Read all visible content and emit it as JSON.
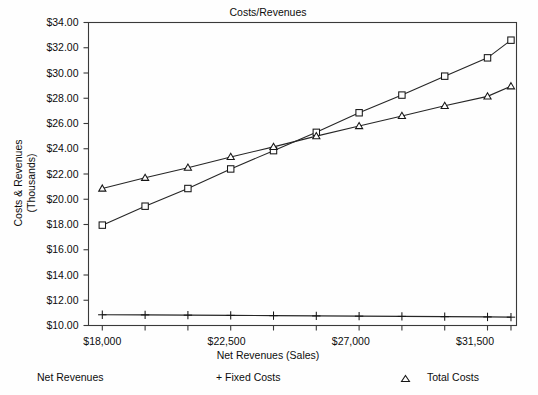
{
  "chart_data": {
    "type": "line",
    "title": "Costs/Revenues",
    "xlabel": "Net Revenues (Sales)",
    "ylabel": "Costs & Revenues (Thousands)",
    "ylabel_line1": "Costs & Revenues",
    "ylabel_line2": "(Thousands)",
    "xlim": [
      17500,
      33000
    ],
    "ylim": [
      10.0,
      34.0
    ],
    "grid": false,
    "legend_position": "bottom",
    "x": [
      18000,
      19550,
      21100,
      22650,
      24200,
      25750,
      27300,
      28850,
      30400,
      31950,
      32800
    ],
    "x_tick_values": [
      18000,
      22500,
      27000,
      31500
    ],
    "x_tick_labels": [
      "$18,000",
      "$22,500",
      "$27,000",
      "$31,500"
    ],
    "y_tick_values": [
      10.0,
      12.0,
      14.0,
      16.0,
      18.0,
      20.0,
      22.0,
      24.0,
      26.0,
      28.0,
      30.0,
      32.0,
      34.0
    ],
    "y_tick_labels": [
      "$10.00",
      "$12.00",
      "$14.00",
      "$16.00",
      "$18.00",
      "$20.00",
      "$22.00",
      "$24.00",
      "$26.00",
      "$28.00",
      "$30.00",
      "$32.00",
      "$34.00"
    ],
    "series": [
      {
        "name": "Net Revenues",
        "marker": "square",
        "values": [
          17.95,
          19.45,
          20.85,
          22.4,
          23.85,
          25.3,
          26.85,
          28.25,
          29.75,
          31.2,
          32.6
        ]
      },
      {
        "name": "+ Fixed Costs",
        "marker": "plus",
        "values": [
          10.85,
          10.84,
          10.82,
          10.8,
          10.78,
          10.76,
          10.74,
          10.72,
          10.7,
          10.68,
          10.66
        ]
      },
      {
        "name": "Total Costs",
        "marker": "triangle",
        "values": [
          20.85,
          21.7,
          22.5,
          23.35,
          24.15,
          25.0,
          25.8,
          26.6,
          27.4,
          28.15,
          28.95
        ]
      }
    ]
  },
  "legend": {
    "entries": [
      {
        "label": "Net Revenues",
        "marker": "none"
      },
      {
        "label": "+ Fixed Costs",
        "marker": "plus-inline"
      },
      {
        "label": "Total Costs",
        "marker": "triangle"
      }
    ]
  },
  "colors": {
    "line": "#262626",
    "frame": "#3a3a3a",
    "background": "#fefefe",
    "text": "#0d0d0d"
  }
}
